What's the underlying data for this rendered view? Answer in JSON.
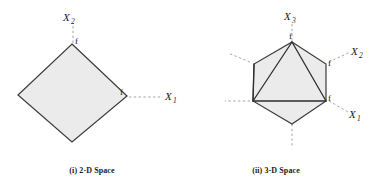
{
  "figure": {
    "panels": [
      {
        "id": "2d",
        "caption": "(i) 2-D Space",
        "shape": "diamond",
        "axes": [
          {
            "name": "X",
            "subscript": "2",
            "label_text": "X",
            "direction": "up"
          },
          {
            "name": "X",
            "subscript": "1",
            "label_text": "X",
            "direction": "right"
          }
        ],
        "vertex_labels": [
          "f",
          "f"
        ]
      },
      {
        "id": "3d",
        "caption": "(ii) 3-D Space",
        "shape": "hexagon-with-triangular-facets",
        "axes": [
          {
            "name": "X",
            "subscript": "3",
            "label_text": "X",
            "direction": "up"
          },
          {
            "name": "X",
            "subscript": "2",
            "label_text": "X",
            "direction": "upper-right"
          },
          {
            "name": "X",
            "subscript": "1",
            "label_text": "X",
            "direction": "lower-right"
          }
        ],
        "vertex_labels": [
          "f",
          "f",
          "f"
        ]
      }
    ],
    "colors": {
      "fill": "#ebebeb",
      "outline": "#3b3b3b",
      "inner_edge": "#2e2e2e",
      "axis_dash": "#9a9a9a",
      "text": "#1a1a1a",
      "background": "#ffffff"
    },
    "labels": {
      "f": "f",
      "X": "X",
      "sub1": "1",
      "sub2": "2",
      "sub3": "3"
    }
  }
}
